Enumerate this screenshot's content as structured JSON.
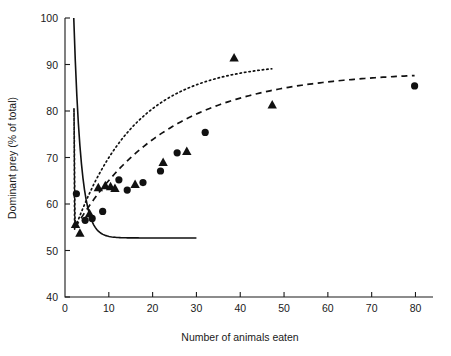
{
  "chart_data": {
    "type": "scatter",
    "title": "",
    "xlabel": "Number of animals eaten",
    "ylabel": "Dominant prey (% of total)",
    "xlim": [
      0,
      84
    ],
    "ylim": [
      40,
      100
    ],
    "xticks": [
      0,
      10,
      20,
      30,
      40,
      50,
      60,
      70,
      80
    ],
    "yticks": [
      40,
      50,
      60,
      70,
      80,
      90,
      100
    ],
    "xtick_labels": [
      "0",
      "10",
      "20",
      "30",
      "40",
      "50",
      "60",
      "70",
      "80"
    ],
    "ytick_labels": [
      "40",
      "50",
      "60",
      "70",
      "80",
      "90",
      "100"
    ],
    "grid": false,
    "legend": "none",
    "series": [
      {
        "name": "circles",
        "marker": "circle",
        "points": [
          {
            "x": 2.6,
            "y": 62.2
          },
          {
            "x": 4.6,
            "y": 56.5
          },
          {
            "x": 6.2,
            "y": 56.9
          },
          {
            "x": 8.6,
            "y": 58.4
          },
          {
            "x": 12.3,
            "y": 65.2
          },
          {
            "x": 14.2,
            "y": 63.0
          },
          {
            "x": 17.8,
            "y": 64.6
          },
          {
            "x": 21.8,
            "y": 67.1
          },
          {
            "x": 25.6,
            "y": 71.0
          },
          {
            "x": 32.0,
            "y": 75.4
          },
          {
            "x": 79.8,
            "y": 85.4
          }
        ]
      },
      {
        "name": "triangles",
        "marker": "triangle",
        "points": [
          {
            "x": 2.4,
            "y": 55.7
          },
          {
            "x": 3.4,
            "y": 53.8
          },
          {
            "x": 5.6,
            "y": 58.0
          },
          {
            "x": 7.6,
            "y": 63.6
          },
          {
            "x": 9.2,
            "y": 64.0
          },
          {
            "x": 10.4,
            "y": 63.8
          },
          {
            "x": 11.4,
            "y": 63.4
          },
          {
            "x": 16.0,
            "y": 64.3
          },
          {
            "x": 22.4,
            "y": 69.0
          },
          {
            "x": 27.8,
            "y": 71.4
          },
          {
            "x": 38.6,
            "y": 91.5
          },
          {
            "x": 47.3,
            "y": 81.4
          }
        ]
      }
    ],
    "curves": [
      {
        "name": "solid-curve",
        "style": "solid",
        "description": "decaying curve from 100 at x=2 to asymptote 52.7 near x=30"
      },
      {
        "name": "dashed-curve",
        "style": "dashed",
        "description": "rising curve from 55 at x=2.5 to 85.5 at x=80"
      },
      {
        "name": "dotted-curve",
        "style": "dotted",
        "description": "rising curve from 55 at x=2.3 through 80 at x=2 up to 87 at x=47"
      }
    ]
  },
  "axes": {
    "x_title": "Number of animals eaten",
    "y_title": "Dominant prey (% of total)"
  }
}
